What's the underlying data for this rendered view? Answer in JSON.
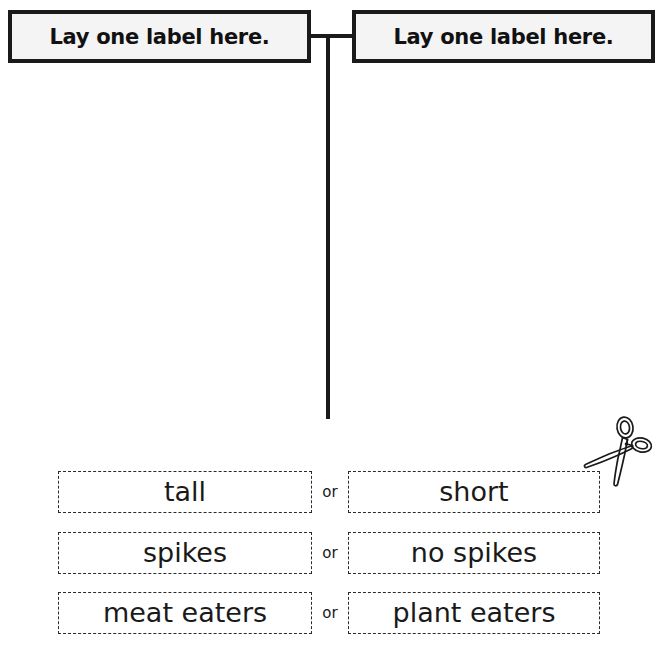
{
  "worksheet": {
    "header": {
      "left_box": {
        "label": "Lay one label here.",
        "icon": "label-placeholder-box"
      },
      "right_box": {
        "label": "Lay one label here.",
        "icon": "label-placeholder-box"
      },
      "connector": "t-connector-line"
    },
    "scissors": {
      "icon": "scissors-icon",
      "meaning": "cut along dashed lines"
    },
    "separator_word": "or",
    "choices": [
      {
        "left": "tall",
        "or": "or",
        "right": "short"
      },
      {
        "left": "spikes",
        "or": "or",
        "right": "no spikes"
      },
      {
        "left": "meat eaters",
        "or": "or",
        "right": "plant eaters"
      }
    ],
    "colors": {
      "ink": "#1a1a1a",
      "box_fill": "#f4f4f4",
      "page": "#ffffff",
      "dash_border": "#2a2a2a"
    }
  }
}
